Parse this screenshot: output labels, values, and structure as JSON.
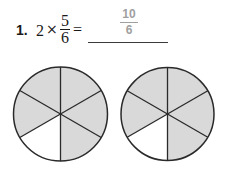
{
  "problem": {
    "number": "1.",
    "whole": "2",
    "operator": "×",
    "fraction": {
      "numerator": "5",
      "denominator": "6"
    },
    "equals": "=",
    "answer": {
      "numerator": "10",
      "denominator": "6"
    }
  },
  "models": [
    {
      "label": "circle-1",
      "parts": 6,
      "shaded": 5,
      "unshaded_sector": "lower-left"
    },
    {
      "label": "circle-2",
      "parts": 6,
      "shaded": 5,
      "unshaded_sector": "lower-left"
    }
  ],
  "colors": {
    "shaded": "#d9d9d9",
    "unshaded": "#ffffff",
    "stroke": "#2a2a2a",
    "answer_text": "#a0a0a0"
  }
}
